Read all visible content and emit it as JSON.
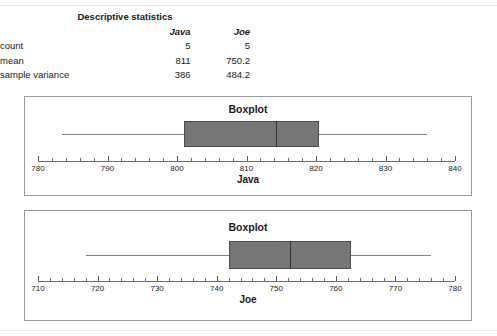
{
  "stats_table": {
    "title": "Descriptive statistics",
    "columns": [
      "",
      "Java",
      "Joe"
    ],
    "rows": [
      {
        "label": "count",
        "java": "5",
        "joe": "5"
      },
      {
        "label": "mean",
        "java": "811",
        "joe": "750.2"
      },
      {
        "label": "sample variance",
        "java": "386",
        "joe": "484.2"
      }
    ]
  },
  "colors": {
    "box_fill": "#767676",
    "box_border": "#4d4d4d",
    "whisker": "#808080",
    "median": "#333333",
    "axis": "#6e6e6e",
    "panel_border": "#9a9a9a"
  },
  "chart_data": [
    {
      "type": "boxplot",
      "title": "Boxplot",
      "xlabel": "Java",
      "ylabel": "",
      "orientation": "horizontal",
      "xlim": [
        780,
        840
      ],
      "tick_step": 2,
      "label_step": 10,
      "tick_labels": [
        "780",
        "790",
        "800",
        "810",
        "820",
        "830",
        "840"
      ],
      "grid": false,
      "legend": "none",
      "series": [
        {
          "name": "Java",
          "whisker_low": 783.5,
          "q1": 801.0,
          "median": 814.3,
          "q3": 820.5,
          "whisker_high": 836.0
        }
      ]
    },
    {
      "type": "boxplot",
      "title": "Boxplot",
      "xlabel": "Joe",
      "ylabel": "",
      "orientation": "horizontal",
      "xlim": [
        710,
        780
      ],
      "tick_step": 2,
      "label_step": 10,
      "tick_labels": [
        "710",
        "720",
        "730",
        "740",
        "750",
        "760",
        "770",
        "780"
      ],
      "grid": false,
      "legend": "none",
      "series": [
        {
          "name": "Joe",
          "whisker_low": 718.0,
          "q1": 742.0,
          "median": 752.3,
          "q3": 762.5,
          "whisker_high": 776.0
        }
      ]
    }
  ]
}
